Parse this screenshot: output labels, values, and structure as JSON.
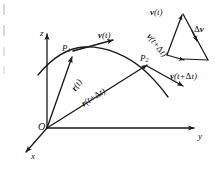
{
  "figure": {
    "stroke_color": "#1a1a1a",
    "background_color": "#ffffff",
    "width": 222,
    "height": 169
  },
  "axes": {
    "z_label": "z",
    "y_label": "y",
    "x_label": "x",
    "origin_label": "O"
  },
  "points": {
    "p1_label": "P",
    "p1_subscript": "1",
    "p2_label": "P",
    "p2_subscript": "2"
  },
  "vectors": {
    "r_t": {
      "symbol": "r",
      "arg": "(t)"
    },
    "r_t_dt": {
      "symbol": "r",
      "arg_open": "(t+",
      "delta": "Δ",
      "arg_close": "t)"
    },
    "v_t_curve": {
      "symbol": "v",
      "arg": "(t)"
    },
    "v_t_dt_curve": {
      "symbol": "v",
      "arg_open": "(t+",
      "delta": "Δ",
      "arg_close": "t)"
    }
  },
  "triangle": {
    "v_t": {
      "symbol": "v",
      "arg": "(t)"
    },
    "v_t_dt": {
      "symbol": "v",
      "arg_open": "(t+",
      "delta": "Δ",
      "arg_close": "t)"
    },
    "delta_v": {
      "delta": "Δ",
      "symbol": "v"
    }
  }
}
